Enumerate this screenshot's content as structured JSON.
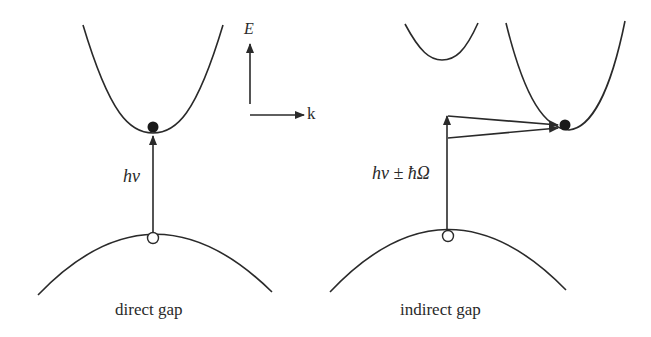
{
  "diagram": {
    "axes": {
      "energy_label": "E",
      "momentum_label": "k"
    },
    "panels": [
      {
        "id": "direct",
        "caption": "direct gap",
        "transition_label": "hν",
        "elements": [
          "conduction-band",
          "valence-band",
          "electron",
          "hole",
          "photon-transition-arrow"
        ]
      },
      {
        "id": "indirect",
        "caption": "indirect gap",
        "transition_label": "hν ± ħΩ",
        "elements": [
          "conduction-band-secondary-minimum",
          "conduction-band-main-minimum",
          "valence-band",
          "electron",
          "hole",
          "photon-transition-arrow",
          "phonon-arrows"
        ]
      }
    ],
    "colors": {
      "line": "#2a2a2a",
      "background": "#ffffff"
    }
  }
}
